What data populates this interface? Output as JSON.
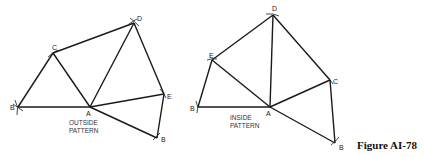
{
  "figure_label": "Figure AI-78",
  "left": {
    "caption_line1": "OUTSIDE",
    "caption_line2": "PATTERN",
    "points": {
      "B1": "B",
      "A": "A",
      "C": "C",
      "D": "D",
      "E": "E",
      "B2": "B"
    }
  },
  "right": {
    "caption_line1": "INSIDE",
    "caption_line2": "PATTERN",
    "points": {
      "B1": "B",
      "A": "A",
      "E": "E",
      "D": "D",
      "C": "C",
      "B2": "B"
    }
  }
}
